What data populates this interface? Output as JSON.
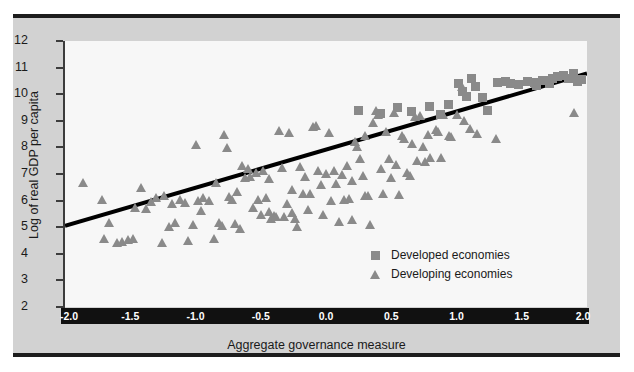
{
  "chart_data": {
    "type": "scatter",
    "title": "",
    "xlabel": "Aggregate governance measure",
    "ylabel": "Log of real GDP per capita",
    "xlim": [
      -2.0,
      2.0
    ],
    "ylim": [
      2,
      12
    ],
    "xticks": [
      "-2.0",
      "-1.5",
      "-1.0",
      "-0.5",
      "0.0",
      "0.5",
      "1.0",
      "1.5",
      "2.0"
    ],
    "xtick_values": [
      -2.0,
      -1.5,
      -1.0,
      -0.5,
      0.0,
      0.5,
      1.0,
      1.5,
      2.0
    ],
    "yticks": [
      "12",
      "11",
      "10",
      "9",
      "8",
      "7",
      "6",
      "5",
      "4",
      "3",
      "2"
    ],
    "ytick_values": [
      12,
      11,
      10,
      9,
      8,
      7,
      6,
      5,
      4,
      3,
      2
    ],
    "grid": false,
    "legend_position": "lower-right",
    "marker_color": "#8a8a8a",
    "plot_background": "#f7f7f7",
    "figure_background": "#d2d2d2",
    "trendline": {
      "color": "#000000",
      "width_px": 4,
      "x0": -2.0,
      "y0": 5.05,
      "x1": 2.0,
      "y1": 10.78
    },
    "series": [
      {
        "name": "Developed economies",
        "marker": "square",
        "points": [
          [
            0.25,
            9.42
          ],
          [
            0.42,
            9.3
          ],
          [
            0.55,
            9.52
          ],
          [
            0.66,
            9.35
          ],
          [
            0.8,
            9.56
          ],
          [
            0.88,
            9.25
          ],
          [
            1.02,
            10.42
          ],
          [
            1.05,
            10.12
          ],
          [
            1.08,
            9.95
          ],
          [
            1.12,
            10.62
          ],
          [
            1.15,
            10.3
          ],
          [
            1.2,
            9.88
          ],
          [
            1.24,
            9.4
          ],
          [
            1.32,
            10.45
          ],
          [
            1.38,
            10.5
          ],
          [
            1.42,
            10.42
          ],
          [
            1.48,
            10.38
          ],
          [
            1.55,
            10.48
          ],
          [
            1.6,
            10.44
          ],
          [
            1.66,
            10.55
          ],
          [
            1.7,
            10.52
          ],
          [
            1.74,
            10.6
          ],
          [
            1.78,
            10.68
          ],
          [
            1.82,
            10.72
          ],
          [
            1.86,
            10.62
          ],
          [
            1.9,
            10.8
          ],
          [
            1.93,
            10.48
          ],
          [
            1.96,
            10.58
          ],
          [
            1.72,
            10.42
          ],
          [
            1.62,
            10.35
          ],
          [
            0.94,
            9.62
          ]
        ]
      },
      {
        "name": "Developing economies",
        "marker": "triangle",
        "points": [
          [
            -1.86,
            6.68
          ],
          [
            -1.72,
            6.02
          ],
          [
            -1.7,
            4.55
          ],
          [
            -1.66,
            5.15
          ],
          [
            -1.6,
            4.42
          ],
          [
            -1.56,
            4.46
          ],
          [
            -1.52,
            4.52
          ],
          [
            -1.48,
            4.55
          ],
          [
            -1.46,
            5.72
          ],
          [
            -1.42,
            6.46
          ],
          [
            -1.38,
            5.7
          ],
          [
            -1.34,
            5.95
          ],
          [
            -1.3,
            6.08
          ],
          [
            -1.26,
            4.4
          ],
          [
            -1.2,
            5.02
          ],
          [
            -1.16,
            5.16
          ],
          [
            -1.12,
            6.02
          ],
          [
            -1.08,
            5.9
          ],
          [
            -1.06,
            4.5
          ],
          [
            -1.02,
            5.1
          ],
          [
            -1.0,
            8.08
          ],
          [
            -0.98,
            6.0
          ],
          [
            -0.96,
            5.62
          ],
          [
            -0.94,
            6.1
          ],
          [
            -0.9,
            5.98
          ],
          [
            -0.86,
            4.56
          ],
          [
            -0.84,
            6.66
          ],
          [
            -0.82,
            5.14
          ],
          [
            -0.8,
            5.06
          ],
          [
            -0.78,
            8.48
          ],
          [
            -0.76,
            7.98
          ],
          [
            -0.74,
            6.12
          ],
          [
            -0.72,
            6.04
          ],
          [
            -0.7,
            5.12
          ],
          [
            -0.68,
            6.32
          ],
          [
            -0.66,
            4.94
          ],
          [
            -0.64,
            7.3
          ],
          [
            -0.62,
            6.84
          ],
          [
            -0.6,
            7.2
          ],
          [
            -0.58,
            6.88
          ],
          [
            -0.56,
            5.72
          ],
          [
            -0.54,
            7.04
          ],
          [
            -0.52,
            6.02
          ],
          [
            -0.5,
            5.44
          ],
          [
            -0.48,
            7.12
          ],
          [
            -0.46,
            6.1
          ],
          [
            -0.44,
            6.8
          ],
          [
            -0.42,
            5.3
          ],
          [
            -0.4,
            5.42
          ],
          [
            -0.38,
            5.38
          ],
          [
            -0.36,
            8.6
          ],
          [
            -0.34,
            7.24
          ],
          [
            -0.32,
            5.38
          ],
          [
            -0.3,
            5.86
          ],
          [
            -0.28,
            8.56
          ],
          [
            -0.26,
            6.4
          ],
          [
            -0.24,
            5.3
          ],
          [
            -0.22,
            5.02
          ],
          [
            -0.2,
            7.28
          ],
          [
            -0.18,
            6.24
          ],
          [
            -0.16,
            6.9
          ],
          [
            -0.14,
            5.64
          ],
          [
            -0.12,
            6.26
          ],
          [
            -0.1,
            8.78
          ],
          [
            -0.08,
            8.8
          ],
          [
            -0.06,
            7.1
          ],
          [
            -0.04,
            6.6
          ],
          [
            -0.02,
            5.44
          ],
          [
            0.0,
            7.0
          ],
          [
            0.02,
            8.54
          ],
          [
            0.04,
            6.0
          ],
          [
            0.06,
            7.12
          ],
          [
            0.08,
            6.64
          ],
          [
            0.1,
            5.2
          ],
          [
            0.12,
            6.98
          ],
          [
            0.14,
            6.02
          ],
          [
            0.16,
            7.3
          ],
          [
            0.18,
            6.06
          ],
          [
            0.2,
            6.74
          ],
          [
            0.22,
            8.22
          ],
          [
            0.24,
            8.0
          ],
          [
            0.26,
            7.58
          ],
          [
            0.28,
            6.94
          ],
          [
            0.3,
            6.18
          ],
          [
            0.32,
            6.16
          ],
          [
            0.34,
            5.08
          ],
          [
            0.36,
            8.9
          ],
          [
            0.38,
            9.38
          ],
          [
            0.4,
            9.22
          ],
          [
            0.42,
            7.2
          ],
          [
            0.44,
            6.24
          ],
          [
            0.46,
            8.58
          ],
          [
            0.48,
            7.56
          ],
          [
            0.5,
            6.84
          ],
          [
            0.52,
            9.3
          ],
          [
            0.54,
            7.32
          ],
          [
            0.56,
            6.22
          ],
          [
            0.58,
            8.42
          ],
          [
            0.6,
            8.3
          ],
          [
            0.62,
            7.04
          ],
          [
            0.64,
            6.92
          ],
          [
            0.66,
            8.14
          ],
          [
            0.68,
            9.14
          ],
          [
            0.7,
            7.48
          ],
          [
            0.72,
            9.18
          ],
          [
            0.74,
            8.0
          ],
          [
            0.76,
            7.44
          ],
          [
            0.78,
            8.46
          ],
          [
            0.8,
            7.62
          ],
          [
            0.84,
            8.66
          ],
          [
            0.86,
            8.58
          ],
          [
            0.88,
            7.62
          ],
          [
            0.9,
            9.22
          ],
          [
            0.94,
            8.44
          ],
          [
            0.96,
            8.38
          ],
          [
            1.0,
            9.2
          ],
          [
            1.04,
            10.28
          ],
          [
            1.06,
            9.0
          ],
          [
            1.1,
            8.7
          ],
          [
            1.16,
            8.52
          ],
          [
            1.3,
            8.3
          ],
          [
            1.9,
            9.28
          ],
          [
            -1.24,
            6.18
          ],
          [
            -1.18,
            5.86
          ],
          [
            0.3,
            8.44
          ],
          [
            0.2,
            5.28
          ],
          [
            -0.44,
            5.56
          ],
          [
            -0.26,
            5.54
          ]
        ]
      }
    ]
  },
  "legend": {
    "items": [
      {
        "label": "Developed economies",
        "marker": "square"
      },
      {
        "label": "Developing economies",
        "marker": "triangle"
      }
    ]
  }
}
